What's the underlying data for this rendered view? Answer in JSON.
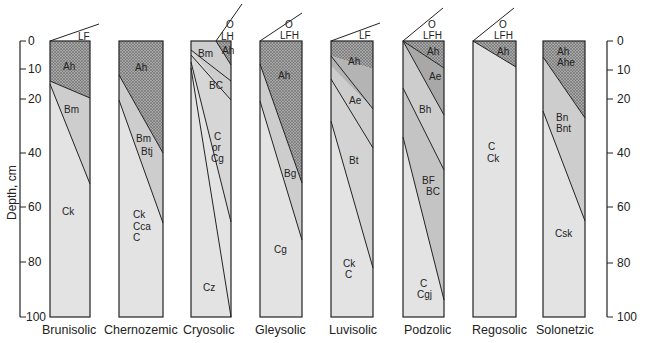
{
  "diagram": {
    "axis_label": "Depth, cm",
    "depth_ticks": [
      "0",
      "10",
      "20",
      "40",
      "60",
      "80",
      "100"
    ],
    "colors": {
      "organic_dotted": "#9a9a9a",
      "dark_horizon": "#b4b4b4",
      "mid_horizon": "#cdcdcd",
      "light_horizon": "#e3e3e3",
      "outline": "#222222"
    },
    "profiles": [
      {
        "name": "Brunisolic",
        "surface": "LF",
        "horizons": [
          "Ah",
          "Bm",
          "Ck"
        ]
      },
      {
        "name": "Chernozemic",
        "surface": "",
        "horizons": [
          "Ah",
          "Bm",
          "Btj",
          "Ck",
          "Cca",
          "C"
        ]
      },
      {
        "name": "Cryosolic",
        "surface_top": "O",
        "surface": "LH",
        "horizons": [
          "Bm",
          "Ah",
          "BC",
          "C",
          "or",
          "Cg",
          "Cz"
        ]
      },
      {
        "name": "Gleysolic",
        "surface_top": "O",
        "surface": "LFH",
        "horizons": [
          "Ah",
          "Bg",
          "Cg"
        ]
      },
      {
        "name": "Luvisolic",
        "surface": "LF",
        "horizons": [
          "Ah",
          "Ae",
          "Bt",
          "Ck",
          "C"
        ]
      },
      {
        "name": "Podzolic",
        "surface_top": "O",
        "surface": "LFH",
        "horizons": [
          "Ah",
          "Ae",
          "Bh",
          "BF",
          "BC",
          "C",
          "Cgj"
        ]
      },
      {
        "name": "Regosolic",
        "surface_top": "O",
        "surface": "LFH",
        "horizons": [
          "Ah",
          "C",
          "Ck"
        ]
      },
      {
        "name": "Solonetzic",
        "surface": "",
        "horizons": [
          "Ah",
          "Ahe",
          "Bn",
          "Bnt",
          "Csk"
        ]
      }
    ]
  }
}
